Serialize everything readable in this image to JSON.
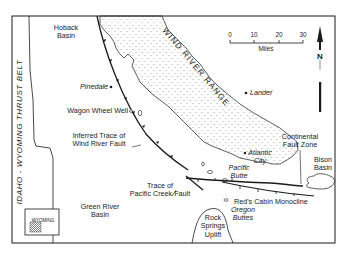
{
  "map": {
    "regions": {
      "hoback_basin": "Hoback\nBasin",
      "hoback_line1": "Hoback",
      "hoback_line2": "Basin",
      "wind_river_range": "WIND RIVER RANGE",
      "thrust_belt": "IDAHO - WYOMING THRUST BELT",
      "green_river_1": "Green River",
      "green_river_2": "Basin",
      "bison_1": "Bison",
      "bison_2": "Basin",
      "rock_1": "Rock",
      "rock_2": "Springs",
      "rock_3": "Uplift"
    },
    "places": {
      "pinedale": "Pinedale",
      "lander": "Lander",
      "atlantic_1": "Atlantic",
      "atlantic_2": "City",
      "pacific_1": "Pacific",
      "pacific_2": "Butte",
      "oregon_1": "Oregon",
      "oregon_2": "Buttes",
      "wagon_wheel": "Wagon Wheel Well"
    },
    "features": {
      "inferred_1": "Inferred Trace of",
      "inferred_2": "Wind River Fault",
      "pacific_creek_1": "Trace of",
      "pacific_creek_2": "Pacific Creek Fault",
      "continental_1": "Continental",
      "continental_2": "Fault Zone",
      "reds_cabin": "Red's Cabin Monocline"
    },
    "scale": {
      "ticks": [
        "0",
        "10",
        "20",
        "30"
      ],
      "unit": "Miles"
    },
    "north_arrow": "N",
    "inset": {
      "label": "WYOMING"
    },
    "colors": {
      "ink": "#1a1a1a",
      "paper": "#ffffff",
      "stipple": "#555555"
    }
  }
}
